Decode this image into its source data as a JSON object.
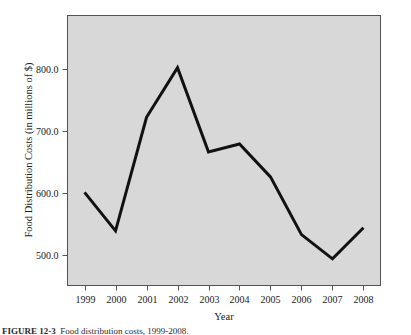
{
  "figure": {
    "plot_background_color": "#d8d8d8",
    "line_color": "#111111",
    "axis_color": "#555555",
    "text_color": "#1a1a1a"
  },
  "caption": {
    "number": "FIGURE 12-3",
    "text": "Food distribution costs, 1999-2008."
  },
  "chart_data": {
    "type": "line",
    "title": "",
    "subtitle": "",
    "xlabel": "Year",
    "ylabel": "Food Distribution Costs (in millions of $)",
    "categories": [
      "1999",
      "2000",
      "2001",
      "2002",
      "2003",
      "2004",
      "2005",
      "2006",
      "2007",
      "2008"
    ],
    "x": [
      1999,
      2000,
      2001,
      2002,
      2003,
      2004,
      2005,
      2006,
      2007,
      2008
    ],
    "values": [
      601,
      539,
      722,
      802,
      666,
      679,
      626,
      533,
      494,
      544
    ],
    "series": [
      {
        "name": "Food Distribution Costs",
        "values": [
          601,
          539,
          722,
          802,
          666,
          679,
          626,
          533,
          494,
          544
        ]
      }
    ],
    "ytick_labels": [
      "800.0",
      "700.0",
      "600.0",
      "500.0"
    ],
    "ytick_values": [
      800,
      700,
      600,
      500
    ],
    "xtick_labels": [
      "1999",
      "2000",
      "2001",
      "2002",
      "2003",
      "2004",
      "2005",
      "2006",
      "2007",
      "2008"
    ],
    "ylim": [
      451,
      886
    ],
    "xlim": [
      1998.45,
      2008.55
    ],
    "grid": false,
    "legend": false,
    "legend_position": "none",
    "markers": false,
    "line_width": 3,
    "annotations": []
  }
}
